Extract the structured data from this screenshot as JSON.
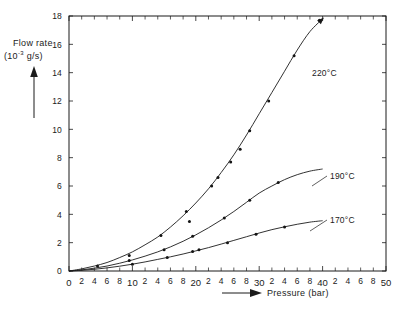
{
  "figure": {
    "background_color": "#ffffff",
    "ink_color": "#1b1b1b"
  },
  "axes": {
    "y_title_line1": "Flow rate",
    "y_title_prefix": "(10",
    "y_title_exponent": "-3",
    "y_title_suffix": " g/s)",
    "x_title": "Pressure (bar)",
    "y_ticks": [
      "0",
      "2",
      "4",
      "6",
      "8",
      "10",
      "12",
      "14",
      "16",
      "18"
    ],
    "x_tick_labels": [
      "0",
      "2",
      "4",
      "6",
      "8",
      "10",
      "2",
      "4",
      "6",
      "8",
      "20",
      "2",
      "4",
      "6",
      "8",
      "30",
      "2",
      "4",
      "6",
      "8",
      "40",
      "2",
      "4",
      "6",
      "8",
      "50"
    ]
  },
  "curve_labels": {
    "hot": "220°C",
    "mid": "190°C",
    "cool": "170°C"
  },
  "chart_data": {
    "type": "line",
    "title": "",
    "subtitle": "",
    "xlabel": "Pressure (bar)",
    "ylabel": "Flow rate (10^-3 g/s)",
    "xlim": [
      0,
      50
    ],
    "ylim": [
      0,
      18
    ],
    "xticks": [
      0,
      2,
      4,
      6,
      8,
      10,
      12,
      14,
      16,
      18,
      20,
      22,
      24,
      26,
      28,
      30,
      32,
      34,
      36,
      38,
      40,
      42,
      44,
      46,
      48,
      50
    ],
    "yticks": [
      0,
      2,
      4,
      6,
      8,
      10,
      12,
      14,
      16,
      18
    ],
    "grid": false,
    "legend_position": "inline-curve-labels",
    "series": [
      {
        "name": "220°C",
        "label_text": "220°C",
        "curve": [
          [
            0,
            0.0
          ],
          [
            2,
            0.15
          ],
          [
            4,
            0.35
          ],
          [
            6,
            0.6
          ],
          [
            8,
            0.95
          ],
          [
            10,
            1.35
          ],
          [
            12,
            1.85
          ],
          [
            14,
            2.4
          ],
          [
            16,
            3.1
          ],
          [
            18,
            3.9
          ],
          [
            20,
            4.8
          ],
          [
            22,
            5.8
          ],
          [
            24,
            6.95
          ],
          [
            26,
            8.2
          ],
          [
            28,
            9.6
          ],
          [
            30,
            11.1
          ],
          [
            32,
            12.6
          ],
          [
            34,
            14.1
          ],
          [
            36,
            15.6
          ],
          [
            38,
            16.9
          ],
          [
            40,
            17.8
          ]
        ],
        "points": [
          [
            4.5,
            0.35
          ],
          [
            9.5,
            1.1
          ],
          [
            14.5,
            2.5
          ],
          [
            18.5,
            4.2
          ],
          [
            19.0,
            3.5
          ],
          [
            22.5,
            6.0
          ],
          [
            23.5,
            6.6
          ],
          [
            25.5,
            7.7
          ],
          [
            27.0,
            8.6
          ],
          [
            28.5,
            9.9
          ],
          [
            31.5,
            12.0
          ],
          [
            35.5,
            15.2
          ],
          [
            39.5,
            17.7
          ]
        ]
      },
      {
        "name": "190°C",
        "label_text": "190°C",
        "curve": [
          [
            0,
            0.0
          ],
          [
            2,
            0.08
          ],
          [
            4,
            0.2
          ],
          [
            6,
            0.35
          ],
          [
            8,
            0.55
          ],
          [
            10,
            0.78
          ],
          [
            12,
            1.05
          ],
          [
            14,
            1.35
          ],
          [
            16,
            1.7
          ],
          [
            18,
            2.1
          ],
          [
            20,
            2.55
          ],
          [
            22,
            3.05
          ],
          [
            24,
            3.6
          ],
          [
            26,
            4.2
          ],
          [
            28,
            4.85
          ],
          [
            30,
            5.5
          ],
          [
            32,
            6.0
          ],
          [
            34,
            6.45
          ],
          [
            36,
            6.8
          ],
          [
            38,
            7.05
          ],
          [
            40,
            7.2
          ]
        ],
        "points": [
          [
            9.5,
            0.75
          ],
          [
            15.0,
            1.5
          ],
          [
            19.5,
            2.45
          ],
          [
            24.5,
            3.75
          ],
          [
            28.5,
            5.0
          ],
          [
            33.0,
            6.25
          ]
        ]
      },
      {
        "name": "170°C",
        "label_text": "170°C",
        "curve": [
          [
            0,
            0.0
          ],
          [
            2,
            0.05
          ],
          [
            4,
            0.12
          ],
          [
            6,
            0.22
          ],
          [
            8,
            0.34
          ],
          [
            10,
            0.48
          ],
          [
            12,
            0.64
          ],
          [
            14,
            0.82
          ],
          [
            16,
            1.0
          ],
          [
            18,
            1.2
          ],
          [
            20,
            1.42
          ],
          [
            22,
            1.65
          ],
          [
            24,
            1.9
          ],
          [
            26,
            2.16
          ],
          [
            28,
            2.42
          ],
          [
            30,
            2.68
          ],
          [
            32,
            2.92
          ],
          [
            34,
            3.12
          ],
          [
            36,
            3.3
          ],
          [
            38,
            3.45
          ],
          [
            40,
            3.55
          ]
        ],
        "points": [
          [
            10.0,
            0.48
          ],
          [
            15.5,
            0.95
          ],
          [
            19.5,
            1.38
          ],
          [
            20.5,
            1.5
          ],
          [
            25.0,
            2.0
          ],
          [
            29.5,
            2.6
          ],
          [
            34.0,
            3.1
          ]
        ]
      }
    ]
  }
}
